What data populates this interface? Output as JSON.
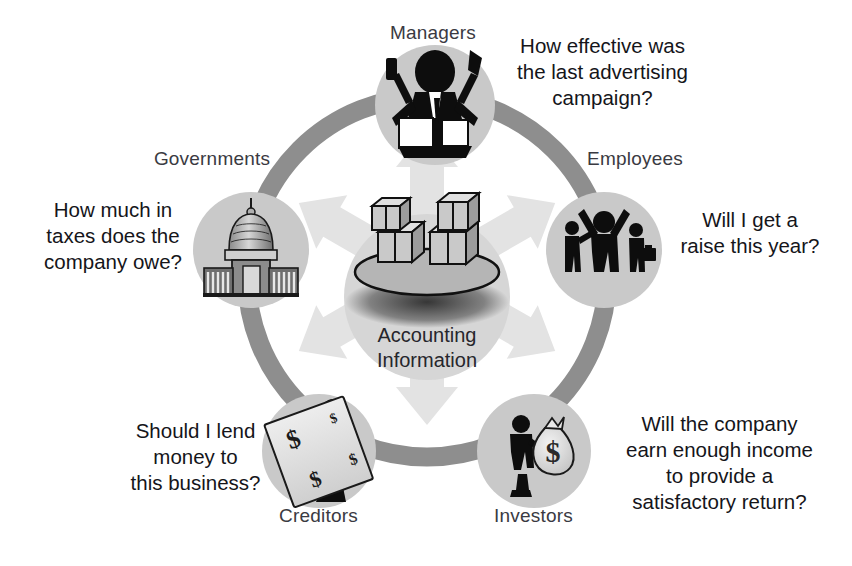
{
  "diagram": {
    "center": {
      "caption_line1": "Accounting",
      "caption_line2": "Information",
      "icon": "boxes-on-platter-icon"
    },
    "colors": {
      "ring": "#8e8e8e",
      "node_circle": "#c9c9c9",
      "center_circle": "#d6d6d6",
      "arrow": "#e2e2e2",
      "label_text": "#3a3a42",
      "question_text": "#15151a",
      "background": "#ffffff"
    },
    "nodes": [
      {
        "id": "managers",
        "label": "Managers",
        "icon": "manager-multitasking-icon",
        "question": "How effective was the last advertising campaign?",
        "question_lines": [
          "How effective was",
          "the last advertising",
          "campaign?"
        ]
      },
      {
        "id": "employees",
        "label": "Employees",
        "icon": "employees-group-icon",
        "question": "Will I get a raise this year?",
        "question_lines": [
          "Will I get a",
          "raise this year?"
        ]
      },
      {
        "id": "investors",
        "label": "Investors",
        "icon": "investor-money-bag-icon",
        "question": "Will the company earn enough income to provide a satisfactory return?",
        "question_lines": [
          "Will the company",
          "earn enough income",
          "to provide a",
          "satisfactory return?"
        ]
      },
      {
        "id": "creditors",
        "label": "Creditors",
        "icon": "creditor-giant-check-icon",
        "question": "Should I lend money to this business?",
        "question_lines": [
          "Should I lend",
          "money to",
          "this business?"
        ]
      },
      {
        "id": "governments",
        "label": "Governments",
        "icon": "capitol-building-icon",
        "question": "How much in taxes does the company owe?",
        "question_lines": [
          "How much in",
          "taxes does the",
          "company owe?"
        ]
      }
    ]
  }
}
